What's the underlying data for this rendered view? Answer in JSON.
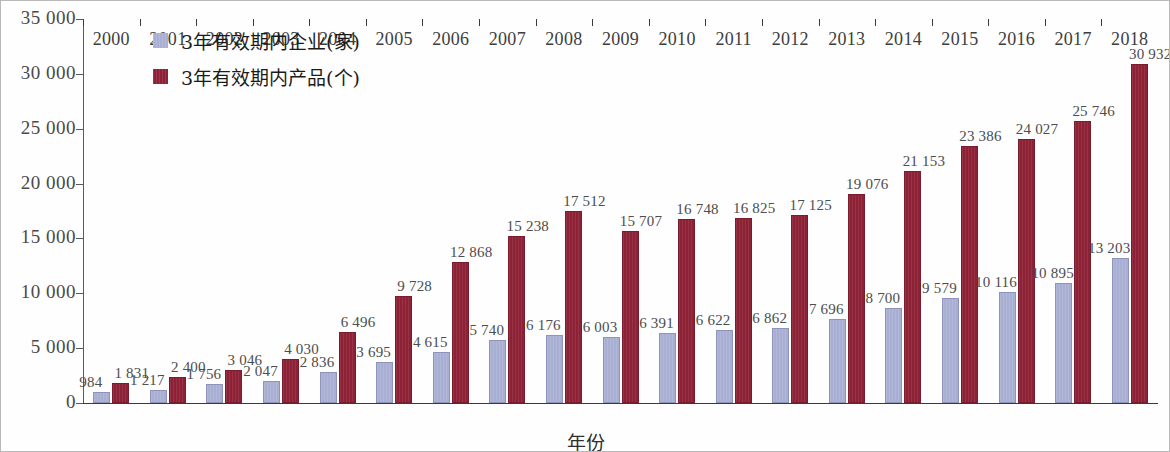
{
  "chart_data": {
    "type": "bar",
    "title": "",
    "xlabel": "年份",
    "ylabel": "",
    "ylim": [
      0,
      35000
    ],
    "ytick_step": 5000,
    "ytick_labels": [
      "35 000",
      "30 000",
      "25 000",
      "20 000",
      "15 000",
      "10 000",
      "5 000",
      "0"
    ],
    "grid": false,
    "legend_position": "top-left",
    "categories": [
      "2000",
      "2001",
      "2002",
      "2003",
      "2004",
      "2005",
      "2006",
      "2007",
      "2008",
      "2009",
      "2010",
      "2011",
      "2012",
      "2013",
      "2014",
      "2015",
      "2016",
      "2017",
      "2018"
    ],
    "series": [
      {
        "name": "3年有效期内企业(家)",
        "color": "#a9afd2",
        "values": [
          984,
          1217,
          1756,
          2047,
          2836,
          3695,
          4615,
          5740,
          6176,
          6003,
          6391,
          6622,
          6862,
          7696,
          8700,
          9579,
          10116,
          10895,
          13203
        ],
        "labels": [
          "984",
          "1 217",
          "1 756",
          "2 047",
          "2 836",
          "3 695",
          "4 615",
          "5 740",
          "6 176",
          "6 003",
          "6 391",
          "6 622",
          "6 862",
          "7 696",
          "8 700",
          "9 579",
          "10 116",
          "10 895",
          "13 203"
        ]
      },
      {
        "name": "3年有效期内产品(个)",
        "color": "#8d2236",
        "values": [
          1831,
          2400,
          3046,
          4030,
          6496,
          9728,
          12868,
          15238,
          17512,
          15707,
          16748,
          16825,
          17125,
          19076,
          21153,
          23386,
          24027,
          25746,
          30932
        ],
        "labels": [
          "1 831",
          "2 400",
          "3 046",
          "4 030",
          "6 496",
          "9 728",
          "12 868",
          "15 238",
          "17 512",
          "15 707",
          "16 748",
          "16 825",
          "17 125",
          "19 076",
          "21 153",
          "23 386",
          "24 027",
          "25 746",
          "30 932"
        ]
      }
    ]
  },
  "legend": {
    "items": [
      {
        "label": "3年有效期内企业(家)",
        "swatch": "enterprises"
      },
      {
        "label": "3年有效期内产品(个)",
        "swatch": "products"
      }
    ]
  },
  "axis": {
    "x_title": "年份"
  }
}
